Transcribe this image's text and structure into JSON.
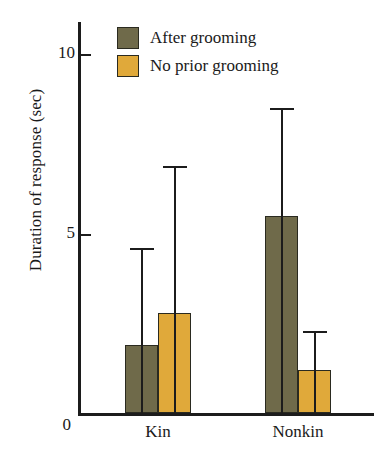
{
  "chart_data": {
    "type": "bar",
    "title": "",
    "subtitle": "",
    "xlabel": "",
    "ylabel": "Duration of response (sec)",
    "categories": [
      "Kin",
      "Nonkin"
    ],
    "ylim": [
      0,
      10.9
    ],
    "yticks": [
      0,
      5,
      10
    ],
    "ytick_labels": [
      "0",
      "5",
      "10"
    ],
    "grid": false,
    "legend_position": "top-left",
    "error_bar_type": "upper",
    "series": [
      {
        "name": "After grooming",
        "color": "#6f6a4a",
        "values": [
          1.9,
          5.5
        ],
        "errors_upper": [
          4.6,
          8.5
        ]
      },
      {
        "name": "No prior grooming",
        "color": "#e0a93a",
        "values": [
          2.8,
          1.2
        ],
        "errors_upper": [
          6.9,
          2.3
        ]
      }
    ]
  },
  "axis": {
    "y_title": "Duration of response (sec)",
    "y_tick_0": "0",
    "y_tick_5": "5",
    "y_tick_10": "10",
    "x_tick_kin": "Kin",
    "x_tick_nonkin": "Nonkin"
  },
  "legend": {
    "items": [
      {
        "label": "After grooming",
        "color": "#6f6a4a"
      },
      {
        "label": "No prior grooming",
        "color": "#e0a93a"
      }
    ]
  }
}
